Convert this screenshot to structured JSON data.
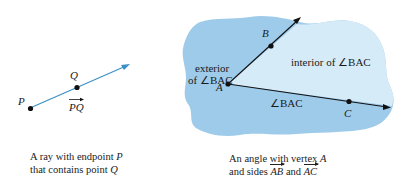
{
  "left_figure": {
    "label_P": "P",
    "label_Q": "Q",
    "label_ray": "PQ",
    "caption_line1_prefix": "A ray with endpoint ",
    "caption_line1_var": "P",
    "caption_line2_prefix": "that contains point ",
    "caption_line2_var": "Q",
    "ray_color": "#3a8fc7"
  },
  "right_figure": {
    "label_A": "A",
    "label_B": "B",
    "label_C": "C",
    "exterior_line1": "exterior",
    "exterior_line2": "of ∠BAC",
    "interior_label": "interior of ∠BAC",
    "angle_label": "∠BAC",
    "caption_line1_prefix": "An angle with vertex ",
    "caption_line1_var": "A",
    "caption_line2_prefix": "and sides ",
    "caption_side1": "AB",
    "caption_and": " and ",
    "caption_side2": "AC",
    "exterior_color": "#9fcbea",
    "interior_color": "#d6ebf8"
  }
}
